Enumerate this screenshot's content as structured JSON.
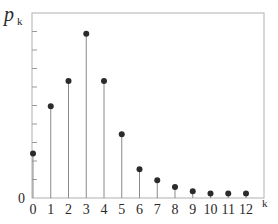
{
  "chart_data": {
    "type": "stem",
    "title": "",
    "ylabel": "p",
    "ylabel_subscript": "k",
    "xlabel": "k",
    "x": [
      0,
      1,
      2,
      3,
      4,
      5,
      6,
      7,
      8,
      9,
      10,
      11,
      12
    ],
    "categories": [
      "0",
      "1",
      "2",
      "3",
      "4",
      "5",
      "6",
      "7",
      "8",
      "9",
      "10",
      "11",
      "12"
    ],
    "values": [
      0.06,
      0.124,
      0.158,
      0.222,
      0.158,
      0.086,
      0.039,
      0.024,
      0.015,
      0.009,
      0.006,
      0.006,
      0.006
    ],
    "ylim": [
      0,
      0.25
    ],
    "y_tick_labels": [
      "0"
    ],
    "y_minor_ticks": 10,
    "grid": false,
    "legend": null
  },
  "axis": {
    "y_zero_label": "0",
    "x_axis_label": "k",
    "y_axis_symbol": "p",
    "y_axis_subscript": "k"
  },
  "caption_partial": "(truncated caption text below axis, unreadable)"
}
